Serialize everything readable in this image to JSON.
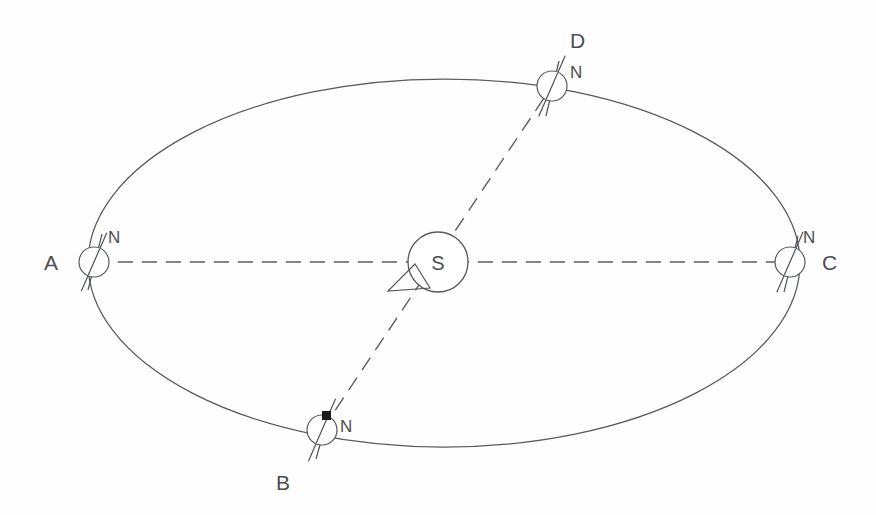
{
  "diagram": {
    "type": "orbit-diagram",
    "title": "",
    "background_color": "#fefefe",
    "stroke_color": "#55595d",
    "canvas": {
      "width": 876,
      "height": 515
    },
    "orbit": {
      "name": "elliptical-orbit-path",
      "center_x": 444,
      "center_y": 263,
      "radius_x": 356,
      "radius_y": 184,
      "style": "solid"
    },
    "sun": {
      "label": "S",
      "center_x": 438,
      "center_y": 262,
      "radius": 30
    },
    "sweep_marker": {
      "name": "area-sweep-triangle",
      "points": "415,264 388,291 430,288"
    },
    "axis_lines": [
      {
        "name": "line-A-to-C",
        "x1": 94,
        "y1": 262,
        "x2": 790,
        "y2": 262,
        "style": "dashed"
      },
      {
        "name": "line-B-to-D",
        "x1": 322,
        "y1": 430,
        "x2": 552,
        "y2": 86,
        "style": "dashed"
      }
    ],
    "positions": [
      {
        "id": "A",
        "label": "A",
        "pole_label": "N",
        "center_x": 94,
        "center_y": 262,
        "radius": 15,
        "label_x": 44,
        "label_y": 270,
        "pole_label_x": 108,
        "pole_label_y": 243,
        "tilt_deg": 23.5,
        "axis_half_length": 32,
        "has_pole_dot": false
      },
      {
        "id": "B",
        "label": "B",
        "pole_label": "N",
        "center_x": 322,
        "center_y": 430,
        "radius": 15,
        "label_x": 276,
        "label_y": 490,
        "pole_label_x": 340,
        "pole_label_y": 432,
        "tilt_deg": 23.5,
        "axis_half_length": 34,
        "has_pole_dot": true,
        "pole_dot_x": 327,
        "pole_dot_y": 416
      },
      {
        "id": "C",
        "label": "C",
        "pole_label": "N",
        "center_x": 790,
        "center_y": 262,
        "radius": 15,
        "label_x": 822,
        "label_y": 270,
        "pole_label_x": 803,
        "pole_label_y": 243,
        "tilt_deg": 23.5,
        "axis_half_length": 33,
        "has_pole_dot": false
      },
      {
        "id": "D",
        "label": "D",
        "pole_label": "N",
        "center_x": 552,
        "center_y": 86,
        "radius": 15,
        "label_x": 570,
        "label_y": 48,
        "pole_label_x": 570,
        "pole_label_y": 78,
        "tilt_deg": 23.5,
        "axis_half_length": 33,
        "has_pole_dot": false
      }
    ],
    "labels": {
      "a": "A",
      "b": "B",
      "c": "C",
      "d": "D",
      "sun": "S",
      "north_pole": "N"
    }
  }
}
